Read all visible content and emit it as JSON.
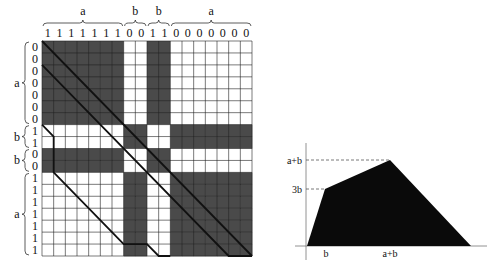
{
  "matrix_figure": {
    "top_groups": [
      {
        "label": "a",
        "bits": "1",
        "count": 7
      },
      {
        "label": "b",
        "bits": "0",
        "count": 2
      },
      {
        "label": "b",
        "bits": "1",
        "count": 2
      },
      {
        "label": "a",
        "bits": "0",
        "count": 7
      }
    ],
    "left_groups": [
      {
        "label": "a",
        "bits": "0",
        "count": 7
      },
      {
        "label": "b",
        "bits": "1",
        "count": 2
      },
      {
        "label": "b",
        "bits": "0",
        "count": 2
      },
      {
        "label": "a",
        "bits": "1",
        "count": 7
      }
    ],
    "shade_rule": "cell shaded when row bit differs from column bit",
    "colors": {
      "shaded": "#4a4a4a",
      "white": "#ffffff",
      "grid": "#222222",
      "path": "#111111"
    }
  },
  "chart_data": {
    "type": "area",
    "title": "",
    "xlabel": "",
    "ylabel": "",
    "x_tick_labels": [
      "b",
      "a+b"
    ],
    "y_tick_labels": [
      "3b",
      "a+b"
    ],
    "polygon": [
      {
        "x": "0",
        "y": "0"
      },
      {
        "x": "b",
        "y": "3b"
      },
      {
        "x": "a+b",
        "y": "a+b"
      },
      {
        "x": "a+b+(a+b)",
        "y": "0"
      }
    ],
    "guides": [
      "dashed line from y-axis at a+b to apex",
      "dashed line from y-axis at 3b to vertex at x=b"
    ],
    "fill": "#0a0a0a"
  }
}
